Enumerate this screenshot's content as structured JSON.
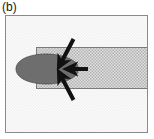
{
  "figure": {
    "panel_label": "(b)",
    "caption_position": "top-left",
    "width": 154,
    "height": 139,
    "background_color": "#ffffff"
  },
  "frame": {
    "name": "outer-frame",
    "x": 5,
    "y": 15,
    "width": 143,
    "height": 118,
    "border_color": "#8a8a8a",
    "border_width": 1,
    "fill_color": "#fbfbfb",
    "texture": "fine-checker",
    "texture_color": "#f2f2f2"
  },
  "band": {
    "name": "horizontal-channel",
    "x": 36,
    "y": 47,
    "width": 112,
    "height": 42,
    "border_color": "#7a7a7a",
    "border_width": 1,
    "fill_color": "#d6d6d6",
    "texture": "checker-hatch",
    "texture_color": "#bdbdbd"
  },
  "ellipse": {
    "name": "droplet",
    "center_x": 47,
    "center_y": 69,
    "radius_x": 31,
    "radius_y": 15,
    "fill_color": "#6e6e6e",
    "stroke_color": "#4a4a4a",
    "notch": "concave-right"
  },
  "arrows": [
    {
      "name": "arrow-upper-diagonal",
      "direction": "down-left",
      "x1": 73,
      "y1": 39,
      "x2": 60,
      "y2": 64,
      "color": "#111111",
      "width": 4
    },
    {
      "name": "arrow-horizontal",
      "direction": "left",
      "x1": 87,
      "y1": 69,
      "x2": 67,
      "y2": 69,
      "color": "#111111",
      "width": 4
    },
    {
      "name": "arrow-lower-diagonal",
      "direction": "up-left",
      "x1": 73,
      "y1": 100,
      "x2": 60,
      "y2": 75,
      "color": "#111111",
      "width": 4
    }
  ],
  "colors": {
    "arrow": "#111111",
    "droplet": "#6e6e6e",
    "channel": "#d6d6d6",
    "frame_border": "#8a8a8a",
    "label_text": "#1a1a1a"
  }
}
